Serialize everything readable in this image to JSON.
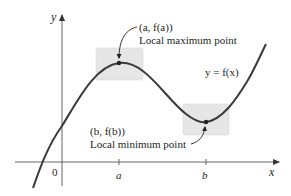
{
  "diagram": {
    "type": "function-graph",
    "axes": {
      "x_label": "x",
      "y_label": "y",
      "origin_label": "0",
      "x_ticks": [
        {
          "label": "a"
        },
        {
          "label": "b"
        }
      ]
    },
    "curve_label": "y = f(x)",
    "points": [
      {
        "coord_label": "(a, f(a))",
        "description": "Local maximum point"
      },
      {
        "coord_label": "(b, f(b))",
        "description": "Local minimum point"
      }
    ],
    "colors": {
      "curve": "#3a3a3a",
      "axes": "#555555",
      "highlight_box": "#e6e6e6",
      "text": "#231f20"
    }
  }
}
